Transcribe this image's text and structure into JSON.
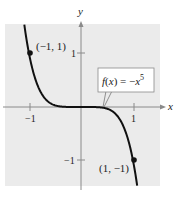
{
  "chart_data": {
    "type": "line",
    "title": "",
    "function_label": "f(x) = −x⁵",
    "function_label_parts": {
      "f": "f(x) = −x",
      "exp": "5"
    },
    "xlabel": "x",
    "ylabel": "y",
    "xlim": [
      -1.45,
      1.52
    ],
    "ylim": [
      -1.48,
      1.55
    ],
    "x_ticks": [
      {
        "value": -1,
        "label": "−1"
      },
      {
        "value": 1,
        "label": "1"
      }
    ],
    "y_ticks": [
      {
        "value": 1,
        "label": "1"
      },
      {
        "value": -1,
        "label": "−1"
      }
    ],
    "grid": false,
    "series": [
      {
        "name": "f(x) = −x^5",
        "expression": "-x^5",
        "x": [
          -1.09,
          -1.0,
          -0.9,
          -0.8,
          -0.7,
          -0.6,
          -0.5,
          -0.4,
          -0.3,
          -0.2,
          -0.1,
          0,
          0.1,
          0.2,
          0.3,
          0.4,
          0.5,
          0.6,
          0.7,
          0.8,
          0.9,
          1.0,
          1.08
        ],
        "y": [
          1.54,
          1.0,
          0.59,
          0.33,
          0.17,
          0.08,
          0.03,
          0.01,
          0.0,
          0.0,
          0.0,
          0,
          0.0,
          0.0,
          0.0,
          -0.01,
          -0.03,
          -0.08,
          -0.17,
          -0.33,
          -0.59,
          -1.0,
          -1.47
        ]
      }
    ],
    "points": [
      {
        "x": -1,
        "y": 1,
        "label": "(−1, 1)"
      },
      {
        "x": 1,
        "y": -1,
        "label": "(1, −1)"
      }
    ],
    "colors": {
      "background": "#ebebeb",
      "curve": "#111111",
      "axis": "#8a8a8a",
      "label_box": "#ffffff"
    }
  }
}
